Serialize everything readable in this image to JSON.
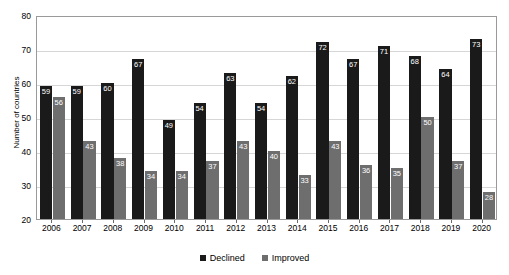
{
  "chart_data": {
    "type": "bar",
    "title": "",
    "xlabel": "",
    "ylabel": "Number of countries",
    "ylim": [
      20,
      80
    ],
    "yticks": [
      20,
      30,
      40,
      50,
      60,
      70,
      80
    ],
    "grid": true,
    "legend_position": "bottom",
    "categories": [
      "2006",
      "2007",
      "2008",
      "2009",
      "2010",
      "2011",
      "2012",
      "2013",
      "2014",
      "2015",
      "2016",
      "2017",
      "2018",
      "2019",
      "2020"
    ],
    "series": [
      {
        "name": "Declined",
        "color": "#1a1a1a",
        "values": [
          59,
          59,
          60,
          67,
          49,
          54,
          63,
          54,
          62,
          72,
          67,
          71,
          68,
          64,
          73
        ]
      },
      {
        "name": "Improved",
        "color": "#6e6e6e",
        "values": [
          56,
          43,
          38,
          34,
          34,
          37,
          43,
          40,
          33,
          43,
          36,
          35,
          50,
          37,
          28
        ]
      }
    ]
  },
  "legend": {
    "items": [
      {
        "label": "Declined"
      },
      {
        "label": "Improved"
      }
    ]
  }
}
